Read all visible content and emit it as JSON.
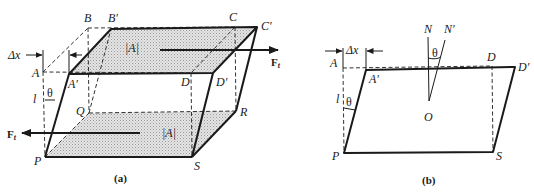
{
  "figure_a": {
    "caption": "(a)",
    "points": {
      "A": "A",
      "A_prime": "A′",
      "B": "B",
      "B_prime": "B′",
      "C": "C",
      "C_prime": "C′",
      "D": "D",
      "D_prime": "D′",
      "P": "P",
      "Q": "Q",
      "R": "R",
      "S": "S"
    },
    "area_label_top": "|A|",
    "area_label_bottom": "|A|",
    "displacement_label": "Δx",
    "height_label": "l",
    "angle_label": "θ",
    "force_label_right": "F",
    "force_label_right_sub": "t",
    "force_label_left": "F",
    "force_label_left_sub": "t"
  },
  "figure_b": {
    "caption": "(b)",
    "points": {
      "A": "A",
      "A_prime": "A′",
      "D": "D",
      "D_prime": "D′",
      "P": "P",
      "S": "S",
      "O": "O",
      "N": "N",
      "N_prime": "N′"
    },
    "displacement_label": "Δx",
    "height_label": "l",
    "angle_label_side": "θ",
    "angle_label_normal": "θ"
  }
}
